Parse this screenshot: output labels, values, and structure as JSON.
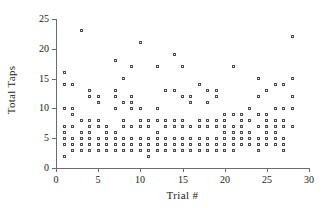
{
  "chart_data": {
    "type": "scatter",
    "title": "",
    "xlabel": "Trial #",
    "ylabel": "Total Taps",
    "xlim": [
      0,
      30
    ],
    "ylim": [
      0,
      25
    ],
    "xticks": [
      0,
      5,
      10,
      15,
      20,
      25,
      30
    ],
    "yticks": [
      0,
      5,
      10,
      15,
      20,
      25
    ],
    "grid": false,
    "legend": "none",
    "marker": "open-square",
    "marker_color": "#4a4a50",
    "axis_color": "#6b6b6b",
    "points": [
      [
        1,
        16
      ],
      [
        1,
        14
      ],
      [
        1,
        10
      ],
      [
        1,
        7
      ],
      [
        1,
        6
      ],
      [
        1,
        5
      ],
      [
        1,
        4
      ],
      [
        1,
        2
      ],
      [
        2,
        14
      ],
      [
        2,
        10
      ],
      [
        2,
        9
      ],
      [
        2,
        7
      ],
      [
        2,
        5
      ],
      [
        2,
        4
      ],
      [
        2,
        3
      ],
      [
        3,
        23
      ],
      [
        3,
        8
      ],
      [
        3,
        6
      ],
      [
        3,
        5
      ],
      [
        3,
        4
      ],
      [
        3,
        3
      ],
      [
        4,
        13
      ],
      [
        4,
        12
      ],
      [
        4,
        8
      ],
      [
        4,
        7
      ],
      [
        4,
        6
      ],
      [
        4,
        5
      ],
      [
        4,
        4
      ],
      [
        4,
        3
      ],
      [
        5,
        12
      ],
      [
        5,
        11
      ],
      [
        5,
        8
      ],
      [
        5,
        7
      ],
      [
        5,
        5
      ],
      [
        5,
        4
      ],
      [
        5,
        3
      ],
      [
        6,
        7
      ],
      [
        6,
        6
      ],
      [
        6,
        5
      ],
      [
        6,
        4
      ],
      [
        6,
        3
      ],
      [
        7,
        18
      ],
      [
        7,
        13
      ],
      [
        7,
        12
      ],
      [
        7,
        10
      ],
      [
        7,
        6
      ],
      [
        7,
        5
      ],
      [
        7,
        4
      ],
      [
        7,
        3
      ],
      [
        8,
        15
      ],
      [
        8,
        11
      ],
      [
        8,
        8
      ],
      [
        8,
        7
      ],
      [
        8,
        5
      ],
      [
        8,
        4
      ],
      [
        8,
        3
      ],
      [
        9,
        17
      ],
      [
        9,
        12
      ],
      [
        9,
        11
      ],
      [
        9,
        10
      ],
      [
        9,
        7
      ],
      [
        9,
        5
      ],
      [
        9,
        4
      ],
      [
        9,
        3
      ],
      [
        10,
        21
      ],
      [
        10,
        10
      ],
      [
        10,
        8
      ],
      [
        10,
        7
      ],
      [
        10,
        5
      ],
      [
        10,
        4
      ],
      [
        10,
        3
      ],
      [
        11,
        8
      ],
      [
        11,
        7
      ],
      [
        11,
        5
      ],
      [
        11,
        4
      ],
      [
        11,
        3
      ],
      [
        11,
        2
      ],
      [
        12,
        17
      ],
      [
        12,
        10
      ],
      [
        12,
        8
      ],
      [
        12,
        6
      ],
      [
        12,
        5
      ],
      [
        12,
        4
      ],
      [
        12,
        3
      ],
      [
        13,
        13
      ],
      [
        13,
        8
      ],
      [
        13,
        7
      ],
      [
        13,
        5
      ],
      [
        13,
        4
      ],
      [
        13,
        3
      ],
      [
        14,
        19
      ],
      [
        14,
        13
      ],
      [
        14,
        8
      ],
      [
        14,
        7
      ],
      [
        14,
        5
      ],
      [
        14,
        4
      ],
      [
        14,
        3
      ],
      [
        15,
        17
      ],
      [
        15,
        12
      ],
      [
        15,
        8
      ],
      [
        15,
        7
      ],
      [
        15,
        5
      ],
      [
        15,
        4
      ],
      [
        15,
        3
      ],
      [
        16,
        12
      ],
      [
        16,
        11
      ],
      [
        16,
        7
      ],
      [
        16,
        5
      ],
      [
        16,
        4
      ],
      [
        16,
        3
      ],
      [
        17,
        14
      ],
      [
        17,
        8
      ],
      [
        17,
        7
      ],
      [
        17,
        5
      ],
      [
        17,
        4
      ],
      [
        17,
        3
      ],
      [
        18,
        13
      ],
      [
        18,
        11
      ],
      [
        18,
        8
      ],
      [
        18,
        7
      ],
      [
        18,
        5
      ],
      [
        18,
        4
      ],
      [
        18,
        3
      ],
      [
        19,
        13
      ],
      [
        19,
        12
      ],
      [
        19,
        8
      ],
      [
        19,
        7
      ],
      [
        19,
        5
      ],
      [
        19,
        4
      ],
      [
        19,
        3
      ],
      [
        20,
        9
      ],
      [
        20,
        8
      ],
      [
        20,
        7
      ],
      [
        20,
        6
      ],
      [
        20,
        5
      ],
      [
        20,
        4
      ],
      [
        20,
        3
      ],
      [
        21,
        17
      ],
      [
        21,
        9
      ],
      [
        21,
        7
      ],
      [
        21,
        6
      ],
      [
        21,
        5
      ],
      [
        21,
        4
      ],
      [
        21,
        3
      ],
      [
        22,
        9
      ],
      [
        22,
        8
      ],
      [
        22,
        7
      ],
      [
        22,
        6
      ],
      [
        22,
        5
      ],
      [
        22,
        4
      ],
      [
        23,
        10
      ],
      [
        23,
        8
      ],
      [
        23,
        6
      ],
      [
        23,
        5
      ],
      [
        23,
        4
      ],
      [
        24,
        15
      ],
      [
        24,
        12
      ],
      [
        24,
        9
      ],
      [
        24,
        7
      ],
      [
        24,
        5
      ],
      [
        24,
        4
      ],
      [
        24,
        3
      ],
      [
        25,
        13
      ],
      [
        25,
        9
      ],
      [
        25,
        8
      ],
      [
        25,
        7
      ],
      [
        25,
        6
      ],
      [
        25,
        5
      ],
      [
        25,
        4
      ],
      [
        26,
        14
      ],
      [
        26,
        10
      ],
      [
        26,
        8
      ],
      [
        26,
        7
      ],
      [
        26,
        6
      ],
      [
        26,
        5
      ],
      [
        26,
        4
      ],
      [
        27,
        14
      ],
      [
        27,
        10
      ],
      [
        27,
        8
      ],
      [
        27,
        7
      ],
      [
        27,
        5
      ],
      [
        27,
        4
      ],
      [
        27,
        3
      ],
      [
        28,
        22
      ],
      [
        28,
        15
      ],
      [
        28,
        12
      ],
      [
        28,
        10
      ],
      [
        28,
        7
      ]
    ]
  },
  "axis": {
    "x_tick_labels": [
      "0",
      "5",
      "10",
      "15",
      "20",
      "25",
      "30"
    ],
    "y_tick_labels": [
      "0",
      "5",
      "10",
      "15",
      "20",
      "25"
    ],
    "x_title": "Trial  #",
    "y_title": "Total Taps"
  }
}
